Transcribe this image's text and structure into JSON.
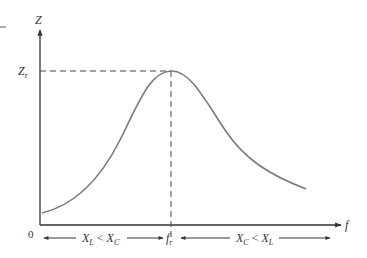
{
  "diagram": {
    "y_axis": {
      "label": "Z",
      "mark_label": "Z",
      "mark_subscript": "r"
    },
    "x_axis": {
      "label": "f",
      "origin_label": "0",
      "mark_label": "f",
      "mark_subscript": "r"
    },
    "regions": {
      "left": {
        "a": "X",
        "a_sub": "L",
        "op": " < ",
        "b": "X",
        "b_sub": "C"
      },
      "right": {
        "a": "X",
        "a_sub": "C",
        "op": " < ",
        "b": "X",
        "b_sub": "L"
      }
    },
    "colors": {
      "axis": "#333333",
      "curve": "#7a7a7a",
      "dashed": "#444444"
    }
  }
}
